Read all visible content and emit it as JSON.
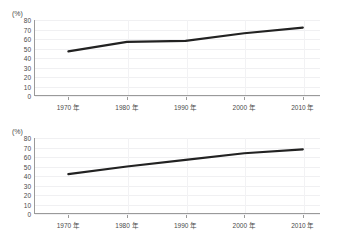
{
  "chart_data": [
    {
      "id": "top",
      "type": "line",
      "title": "",
      "xlabel": "",
      "ylabel": "(%)",
      "unit_label": "(%)",
      "categories": [
        "1970 年",
        "1980 年",
        "1990 年",
        "2000 年",
        "2010 年"
      ],
      "x": [
        1970,
        1980,
        1990,
        2000,
        2010
      ],
      "values": [
        47,
        57,
        58,
        66,
        72
      ],
      "ylim": [
        0,
        80
      ],
      "ytick_values": [
        80,
        70,
        60,
        50,
        40,
        30,
        20,
        10,
        0
      ],
      "ytick_labels": [
        "80",
        "70",
        "60",
        "50",
        "40",
        "30",
        "20",
        "10",
        "0"
      ],
      "grid": true,
      "legend": "none",
      "line_color": "#222222"
    },
    {
      "id": "bottom",
      "type": "line",
      "title": "",
      "xlabel": "",
      "ylabel": "(%)",
      "unit_label": "(%)",
      "categories": [
        "1970 年",
        "1980 年",
        "1990 年",
        "2000 年",
        "2010 年"
      ],
      "x": [
        1970,
        1980,
        1990,
        2000,
        2010
      ],
      "values": [
        42,
        50,
        57,
        64,
        68
      ],
      "ylim": [
        0,
        80
      ],
      "ytick_values": [
        80,
        70,
        60,
        50,
        40,
        30,
        20,
        10,
        0
      ],
      "ytick_labels": [
        "80",
        "70",
        "60",
        "50",
        "40",
        "30",
        "20",
        "10",
        "0"
      ],
      "grid": true,
      "legend": "none",
      "line_color": "#222222"
    }
  ],
  "colors": {
    "background": "#ffffff",
    "axis": "#9a9a9a",
    "gridline": "#f0f0f2",
    "line": "#222222",
    "text": "#4a4a4a"
  }
}
